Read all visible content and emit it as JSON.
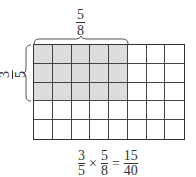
{
  "diagram": {
    "grid": {
      "columns": 8,
      "rows": 5,
      "shaded_columns": 5,
      "shaded_rows": 3,
      "shade_color": "#dcdcdc",
      "line_color": "#333333"
    },
    "top_label": {
      "numerator": "5",
      "denominator": "8"
    },
    "left_label": {
      "numerator": "3",
      "denominator": "5"
    },
    "equation": {
      "a": {
        "numerator": "3",
        "denominator": "5"
      },
      "op": "×",
      "b": {
        "numerator": "5",
        "denominator": "8"
      },
      "eq": "=",
      "result": {
        "numerator": "15",
        "denominator": "40"
      }
    }
  }
}
